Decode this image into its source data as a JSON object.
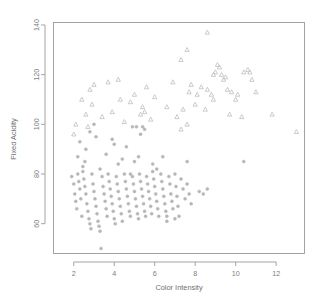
{
  "chart_data": {
    "type": "scatter",
    "title": "",
    "xlabel": "Color Intensity",
    "ylabel": "Fixed Acidity",
    "xlim": [
      1.0,
      13.4
    ],
    "ylim": [
      48,
      141
    ],
    "xticks": [
      2,
      4,
      6,
      8,
      10,
      12
    ],
    "yticks": [
      60,
      80,
      100,
      120,
      140
    ],
    "grid": false,
    "legend": "none",
    "marker_color": "#b9b9b9",
    "frame_color": "#9a9a9a",
    "background": "#ffffff",
    "series": [
      {
        "name": "circles",
        "marker": "circle",
        "color": "#b6b6b6",
        "points": [
          [
            1.9,
            79
          ],
          [
            2.0,
            76
          ],
          [
            2.05,
            72
          ],
          [
            2.1,
            69
          ],
          [
            2.15,
            66
          ],
          [
            2.2,
            80
          ],
          [
            2.25,
            77
          ],
          [
            2.3,
            74
          ],
          [
            2.35,
            70
          ],
          [
            2.4,
            63
          ],
          [
            2.45,
            81
          ],
          [
            2.5,
            78
          ],
          [
            2.55,
            75
          ],
          [
            2.6,
            72
          ],
          [
            2.65,
            68
          ],
          [
            2.7,
            65
          ],
          [
            2.75,
            62
          ],
          [
            2.8,
            60
          ],
          [
            2.85,
            58
          ],
          [
            2.9,
            80
          ],
          [
            2.95,
            76
          ],
          [
            3.0,
            73
          ],
          [
            3.05,
            70
          ],
          [
            3.1,
            67
          ],
          [
            3.15,
            64
          ],
          [
            3.2,
            61
          ],
          [
            3.25,
            59
          ],
          [
            3.3,
            57
          ],
          [
            3.35,
            50
          ],
          [
            3.4,
            79
          ],
          [
            3.45,
            75
          ],
          [
            3.5,
            72
          ],
          [
            3.55,
            69
          ],
          [
            3.6,
            66
          ],
          [
            3.65,
            63
          ],
          [
            3.7,
            80
          ],
          [
            3.75,
            77
          ],
          [
            3.8,
            74
          ],
          [
            3.85,
            71
          ],
          [
            3.9,
            68
          ],
          [
            3.95,
            65
          ],
          [
            4.0,
            62
          ],
          [
            4.05,
            60
          ],
          [
            4.1,
            79
          ],
          [
            4.15,
            76
          ],
          [
            4.2,
            73
          ],
          [
            4.25,
            70
          ],
          [
            4.3,
            67
          ],
          [
            4.35,
            64
          ],
          [
            4.4,
            61
          ],
          [
            4.5,
            80
          ],
          [
            4.55,
            77
          ],
          [
            4.6,
            74
          ],
          [
            4.65,
            71
          ],
          [
            4.7,
            68
          ],
          [
            4.75,
            65
          ],
          [
            4.8,
            63
          ],
          [
            4.9,
            79
          ],
          [
            4.95,
            76
          ],
          [
            5.0,
            73
          ],
          [
            5.05,
            70
          ],
          [
            5.1,
            67
          ],
          [
            5.15,
            64
          ],
          [
            5.2,
            62
          ],
          [
            5.25,
            80
          ],
          [
            5.3,
            77
          ],
          [
            5.35,
            74
          ],
          [
            5.4,
            71
          ],
          [
            5.45,
            68
          ],
          [
            5.5,
            65
          ],
          [
            5.55,
            63
          ],
          [
            5.6,
            79
          ],
          [
            5.65,
            76
          ],
          [
            5.7,
            73
          ],
          [
            5.75,
            70
          ],
          [
            5.8,
            67
          ],
          [
            5.85,
            64
          ],
          [
            5.9,
            81
          ],
          [
            5.95,
            78
          ],
          [
            6.0,
            75
          ],
          [
            6.05,
            72
          ],
          [
            6.1,
            69
          ],
          [
            6.15,
            66
          ],
          [
            6.2,
            63
          ],
          [
            6.3,
            80
          ],
          [
            6.35,
            77
          ],
          [
            6.4,
            74
          ],
          [
            6.45,
            71
          ],
          [
            6.5,
            68
          ],
          [
            6.55,
            65
          ],
          [
            6.6,
            63
          ],
          [
            6.7,
            79
          ],
          [
            6.75,
            76
          ],
          [
            6.8,
            72
          ],
          [
            6.85,
            69
          ],
          [
            6.9,
            66
          ],
          [
            7.0,
            80
          ],
          [
            7.05,
            75
          ],
          [
            7.1,
            71
          ],
          [
            7.15,
            67
          ],
          [
            7.2,
            63
          ],
          [
            7.3,
            78
          ],
          [
            7.4,
            74
          ],
          [
            7.5,
            70
          ],
          [
            7.6,
            76
          ],
          [
            7.7,
            72
          ],
          [
            7.8,
            68
          ],
          [
            8.2,
            73
          ],
          [
            8.4,
            72
          ],
          [
            8.6,
            74
          ],
          [
            5.2,
            87
          ],
          [
            6.4,
            87
          ],
          [
            5.0,
            85
          ],
          [
            4.2,
            84
          ],
          [
            3.6,
            88
          ],
          [
            2.6,
            90
          ],
          [
            2.3,
            93
          ],
          [
            3.1,
            95
          ],
          [
            3.0,
            100
          ],
          [
            4.9,
            99
          ],
          [
            5.1,
            99
          ],
          [
            5.4,
            99
          ],
          [
            5.5,
            98
          ],
          [
            5.3,
            96
          ],
          [
            4.6,
            91
          ],
          [
            4.0,
            92
          ],
          [
            3.9,
            94
          ],
          [
            2.8,
            97
          ],
          [
            2.55,
            85
          ],
          [
            2.45,
            83
          ],
          [
            7.6,
            85
          ],
          [
            10.4,
            85
          ],
          [
            2.2,
            87
          ],
          [
            3.3,
            82
          ],
          [
            6.1,
            82
          ],
          [
            5.9,
            84
          ],
          [
            4.4,
            86
          ],
          [
            4.8,
            80
          ],
          [
            7.0,
            62
          ],
          [
            6.6,
            61
          ]
        ]
      },
      {
        "name": "triangles",
        "marker": "triangle",
        "color": "#c2c2c2",
        "points": [
          [
            8.6,
            137
          ],
          [
            7.6,
            130
          ],
          [
            7.3,
            126
          ],
          [
            9.1,
            124
          ],
          [
            9.2,
            123
          ],
          [
            10.6,
            122
          ],
          [
            10.4,
            121
          ],
          [
            9.0,
            121
          ],
          [
            9.3,
            120
          ],
          [
            10.7,
            121
          ],
          [
            10.8,
            118
          ],
          [
            9.5,
            119
          ],
          [
            9.4,
            118
          ],
          [
            8.9,
            120
          ],
          [
            7.8,
            116
          ],
          [
            8.3,
            115
          ],
          [
            8.6,
            114
          ],
          [
            9.6,
            114
          ],
          [
            7.7,
            113
          ],
          [
            8.1,
            112
          ],
          [
            8.8,
            112
          ],
          [
            9.8,
            113
          ],
          [
            10.1,
            112
          ],
          [
            5.6,
            115
          ],
          [
            5.0,
            112
          ],
          [
            4.2,
            118
          ],
          [
            3.7,
            117
          ],
          [
            3.0,
            116
          ],
          [
            2.8,
            114
          ],
          [
            5.4,
            107
          ],
          [
            5.5,
            105
          ],
          [
            5.3,
            104
          ],
          [
            7.4,
            106
          ],
          [
            8.5,
            106
          ],
          [
            9.7,
            104
          ],
          [
            10.3,
            103
          ],
          [
            11.8,
            104
          ],
          [
            13.0,
            97
          ],
          [
            7.6,
            100
          ],
          [
            7.3,
            98
          ],
          [
            7.1,
            103
          ],
          [
            6.6,
            107
          ],
          [
            4.8,
            109
          ],
          [
            4.3,
            110
          ],
          [
            3.9,
            105
          ],
          [
            2.9,
            108
          ],
          [
            2.4,
            110
          ],
          [
            2.6,
            104
          ],
          [
            2.1,
            100
          ],
          [
            2.0,
            96
          ],
          [
            8.0,
            108
          ],
          [
            8.9,
            110
          ],
          [
            10.0,
            110
          ],
          [
            6.0,
            111
          ],
          [
            6.9,
            117
          ],
          [
            5.8,
            102
          ],
          [
            4.5,
            101
          ],
          [
            3.4,
            103
          ],
          [
            2.7,
            99
          ],
          [
            11.0,
            113
          ]
        ]
      }
    ]
  }
}
